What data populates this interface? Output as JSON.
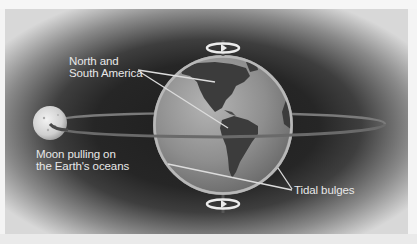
{
  "diagram": {
    "type": "tides-illustration",
    "labels": {
      "americas_line1": "North and",
      "americas_line2": "South America",
      "moon_line1": "Moon pulling on",
      "moon_line2": "the Earth's oceans",
      "tidal_bulges": "Tidal bulges"
    },
    "elements": {
      "earth": "globe showing North and South America",
      "moon": "moon",
      "orbit": "moon orbit ellipse",
      "rotation_arrows": [
        "top rotation arrow",
        "bottom rotation arrow"
      ]
    },
    "colors": {
      "background_center": "#1e1e1e",
      "background_edge": "#d8d8d8",
      "ocean": "#8c8c8c",
      "land": "#3a3a3a",
      "label_text": "#e8e8e8",
      "leader_line": "#dcdcdc"
    }
  }
}
